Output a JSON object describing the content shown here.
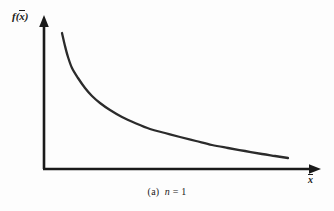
{
  "figure": {
    "caption_index": "(a)",
    "caption_variable": "n",
    "caption_equals": "= 1",
    "caption_full": "(a)  n = 1",
    "y_axis_label_function": "f",
    "y_axis_label_open": "(",
    "y_axis_label_variable": "x",
    "y_axis_label_close": ")",
    "x_axis_label_variable": "x",
    "line_color": "#2b2b2b",
    "axis_color": "#1a1a1a",
    "background_color": "#fdfdfd"
  },
  "chart_data": {
    "type": "line",
    "xlabel": "x̄",
    "ylabel": "f(x̄)",
    "grid": false,
    "legend": false,
    "axis_arrows": true,
    "tick_labels_x": [],
    "tick_labels_y": [],
    "xlim": [
      0,
      1
    ],
    "ylim": [
      0,
      1
    ],
    "series": [
      {
        "name": "f(x-bar), n = 1",
        "points_px": [
          [
            62,
            33
          ],
          [
            65,
            46
          ],
          [
            68,
            57
          ],
          [
            72,
            68
          ],
          [
            78,
            78
          ],
          [
            85,
            88
          ],
          [
            92,
            96
          ],
          [
            100,
            103
          ],
          [
            110,
            110
          ],
          [
            122,
            117
          ],
          [
            135,
            123
          ],
          [
            150,
            129
          ],
          [
            165,
            133
          ],
          [
            180,
            137
          ],
          [
            196,
            141
          ],
          [
            212,
            145
          ],
          [
            228,
            148
          ],
          [
            245,
            151
          ],
          [
            262,
            154
          ],
          [
            275,
            156
          ],
          [
            288,
            158
          ]
        ],
        "x_norm": [
          0.065,
          0.076,
          0.087,
          0.101,
          0.123,
          0.149,
          0.175,
          0.204,
          0.241,
          0.284,
          0.332,
          0.387,
          0.441,
          0.496,
          0.554,
          0.613,
          0.671,
          0.732,
          0.794,
          0.842,
          0.889
        ],
        "y_norm": [
          0.895,
          0.809,
          0.737,
          0.664,
          0.599,
          0.533,
          0.48,
          0.434,
          0.388,
          0.342,
          0.303,
          0.263,
          0.237,
          0.211,
          0.184,
          0.158,
          0.138,
          0.118,
          0.099,
          0.086,
          0.072
        ]
      }
    ],
    "axes_px": {
      "origin": [
        44,
        169
      ],
      "y_axis_top": [
        44,
        17
      ],
      "x_axis_right": [
        320,
        169
      ]
    }
  }
}
